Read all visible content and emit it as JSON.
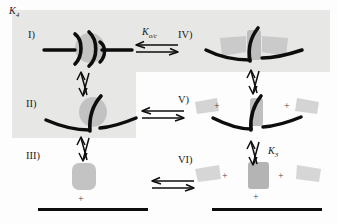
{
  "diagram": {
    "title_label": "K4",
    "type": "equilibrium-scheme",
    "rows": 3,
    "columns": 2,
    "background_bands": [
      {
        "name": "top-row-band",
        "color": "#e7e7e5"
      },
      {
        "name": "left-column-band",
        "color": "#e7e7e5"
      }
    ],
    "colors": {
      "stroke": "#0d0d0d",
      "subunit_gray": "#b8b8b8",
      "subunit_light_gray": "#d2d2d2",
      "band": "#e7e7e5",
      "background": "#fdfdfd"
    }
  },
  "equilibrium_constants": {
    "k4": "K",
    "k4_sub": "4",
    "koc": "K",
    "koc_sub": "o/c",
    "k3": "K",
    "k3_sub": "3"
  },
  "states": [
    {
      "id": "state-1",
      "label": "I)",
      "column": "left",
      "row": 1,
      "description": "flat extended conformation with paired hooks and central gray subunit"
    },
    {
      "id": "state-2",
      "label": "II)",
      "column": "left",
      "row": 2,
      "description": "bent V conformation with central gray subunit"
    },
    {
      "id": "state-3",
      "label": "III)",
      "column": "left",
      "row": 3,
      "description": "dissociated gray subunit above membrane bar"
    },
    {
      "id": "state-4",
      "label": "IV)",
      "column": "right",
      "row": 1,
      "description": "flat conformation with two attached gray wings"
    },
    {
      "id": "state-5",
      "label": "V)",
      "column": "right",
      "row": 2,
      "description": "bent conformation with two detached gray wings"
    },
    {
      "id": "state-6",
      "label": "VI)",
      "column": "right",
      "row": 3,
      "description": "fully dissociated subunits above membrane bar"
    }
  ],
  "arrows": [
    {
      "name": "arrow-I-to-IV",
      "orientation": "horizontal",
      "label_key": "koc"
    },
    {
      "name": "arrow-I-to-II",
      "orientation": "vertical",
      "label_key": null
    },
    {
      "name": "arrow-II-to-V",
      "orientation": "horizontal",
      "label_key": null
    },
    {
      "name": "arrow-II-to-III",
      "orientation": "vertical",
      "label_key": null
    },
    {
      "name": "arrow-IV-to-V",
      "orientation": "vertical",
      "label_key": null
    },
    {
      "name": "arrow-V-to-VI",
      "orientation": "vertical",
      "label_key": "k3"
    },
    {
      "name": "arrow-III-to-VI",
      "orientation": "horizontal",
      "label_key": null
    }
  ],
  "plus_signs": {
    "symbol": "+",
    "count": 7
  },
  "membranes": [
    {
      "name": "membrane-left",
      "row": 3,
      "column": "left"
    },
    {
      "name": "membrane-right",
      "row": 3,
      "column": "right"
    }
  ]
}
